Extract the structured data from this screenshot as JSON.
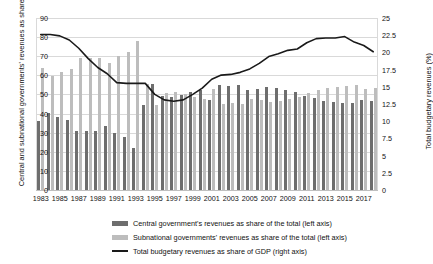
{
  "chart_data": {
    "type": "bar",
    "title": "",
    "xlabel": "",
    "ylabel": "Central and subnational governments' revenues as share of the total (%)",
    "ylabel_right": "Total budgetary revenues (%)",
    "ylim": [
      0,
      90
    ],
    "ylim_right": [
      0,
      25
    ],
    "grid": true,
    "legend_position": "bottom",
    "yticks": [
      "0",
      "10",
      "20",
      "30",
      "40",
      "50",
      "60",
      "70",
      "80",
      "90"
    ],
    "yticks_right": [
      "0",
      "2.5",
      "5",
      "7.5",
      "10",
      "12.5",
      "15",
      "17.5",
      "20",
      "22.5",
      "25"
    ],
    "categories": [
      "1983",
      "1984",
      "1985",
      "1986",
      "1987",
      "1988",
      "1989",
      "1990",
      "1991",
      "1992",
      "1993",
      "1994",
      "1995",
      "1996",
      "1997",
      "1998",
      "1999",
      "2000",
      "2001",
      "2002",
      "2003",
      "2004",
      "2005",
      "2006",
      "2007",
      "2008",
      "2009",
      "2010",
      "2011",
      "2012",
      "2013",
      "2014",
      "2015",
      "2016",
      "2017",
      "2018"
    ],
    "xtick_labels": [
      "1983",
      "1985",
      "1987",
      "1989",
      "1991",
      "1993",
      "1995",
      "1997",
      "1999",
      "2001",
      "2003",
      "2005",
      "2007",
      "2009",
      "2011",
      "2013",
      "2015",
      "2017"
    ],
    "series": [
      {
        "name": "Central government's revenues as share of the total (left axis)",
        "axis": "left",
        "kind": "bar",
        "color": "#6e6e6e",
        "values": [
          36.0,
          40.5,
          38.0,
          36.5,
          31.0,
          31.0,
          30.8,
          33.5,
          29.8,
          28.0,
          22.0,
          44.3,
          55.7,
          49.4,
          48.9,
          49.5,
          51.1,
          52.2,
          47.2,
          55.0,
          54.6,
          54.9,
          52.3,
          52.8,
          54.1,
          53.3,
          52.4,
          51.1,
          49.4,
          47.9,
          46.6,
          45.9,
          45.5,
          45.3,
          47.0,
          46.6
        ]
      },
      {
        "name": "Subnational governments' revenues as share of the total (left axis)",
        "axis": "left",
        "kind": "bar",
        "color": "#bdbdbd",
        "values": [
          64.0,
          59.5,
          62.0,
          63.5,
          69.0,
          69.0,
          69.2,
          66.5,
          70.2,
          72.0,
          78.0,
          55.7,
          44.3,
          50.6,
          51.1,
          50.5,
          48.9,
          47.8,
          52.8,
          45.0,
          45.4,
          45.1,
          47.7,
          47.2,
          45.9,
          46.7,
          47.6,
          48.9,
          50.6,
          52.1,
          53.4,
          54.1,
          54.5,
          54.7,
          53.0,
          53.4
        ]
      },
      {
        "name": "Total budgetary revenues as share of GDP (right axis)",
        "axis": "right",
        "kind": "line",
        "color": "#1a1a1a",
        "values": [
          22.6,
          22.6,
          22.4,
          21.8,
          20.6,
          19.1,
          17.8,
          16.9,
          15.6,
          15.5,
          15.5,
          15.5,
          13.9,
          13.1,
          12.9,
          13.1,
          13.9,
          14.8,
          16.1,
          16.7,
          16.8,
          17.1,
          17.6,
          18.4,
          19.4,
          19.8,
          20.3,
          20.5,
          21.4,
          22.0,
          22.1,
          22.1,
          22.3,
          21.5,
          21.0,
          20.1
        ]
      }
    ],
    "legend": [
      {
        "swatch": "bar-dark",
        "label": "Central government's revenues as share of the total (left axis)"
      },
      {
        "swatch": "bar-light",
        "label": "Subnational governments' revenues as share of the total (left axis)"
      },
      {
        "swatch": "line",
        "label": "Total budgetary revenues as share of GDP (right axis)"
      }
    ]
  }
}
